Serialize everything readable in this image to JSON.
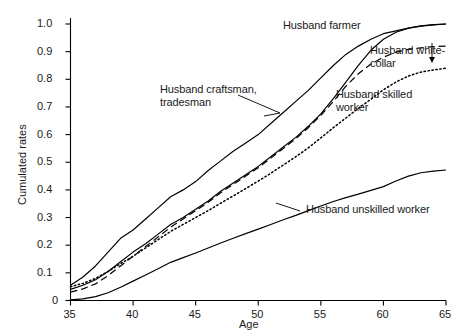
{
  "chart_data": {
    "type": "line",
    "title": "",
    "xlabel": "Age",
    "ylabel": "Cumulated rates",
    "xlim": [
      35,
      65
    ],
    "ylim": [
      0,
      1.0
    ],
    "xticks": [
      35,
      40,
      45,
      50,
      55,
      60,
      65
    ],
    "xtick_labels": [
      "35",
      "40",
      "45",
      "50",
      "55",
      "60",
      "65"
    ],
    "yticks": [
      0,
      0.1,
      0.2,
      0.3,
      0.4,
      0.5,
      0.6,
      0.7,
      0.8,
      0.9,
      1.0
    ],
    "ytick_labels": [
      "0",
      "0.1",
      "0.2",
      "0.3",
      "0.4",
      "0.5",
      "0.6",
      "0.7",
      "0.8",
      "0.9",
      "1.0"
    ],
    "grid": false,
    "legend_position": "inline-annotations",
    "x": [
      35,
      36,
      37,
      38,
      39,
      40,
      41,
      42,
      43,
      44,
      45,
      46,
      47,
      48,
      49,
      50,
      51,
      52,
      53,
      54,
      55,
      56,
      57,
      58,
      59,
      60,
      61,
      62,
      63,
      64,
      65
    ],
    "series": [
      {
        "name": "Husband farmer",
        "style": "solid",
        "color": "#000000",
        "values": [
          0.055,
          0.085,
          0.125,
          0.175,
          0.225,
          0.255,
          0.295,
          0.335,
          0.375,
          0.4,
          0.43,
          0.47,
          0.505,
          0.54,
          0.57,
          0.6,
          0.64,
          0.68,
          0.72,
          0.76,
          0.805,
          0.85,
          0.89,
          0.92,
          0.945,
          0.965,
          0.975,
          0.985,
          0.992,
          0.997,
          1.0
        ]
      },
      {
        "name": "Husband craftsman, tradesman",
        "style": "solid",
        "color": "#000000",
        "values": [
          0.04,
          0.055,
          0.075,
          0.105,
          0.14,
          0.175,
          0.205,
          0.24,
          0.275,
          0.3,
          0.33,
          0.36,
          0.395,
          0.425,
          0.455,
          0.485,
          0.52,
          0.555,
          0.59,
          0.63,
          0.675,
          0.73,
          0.79,
          0.85,
          0.905,
          0.945,
          0.97,
          0.985,
          0.993,
          0.998,
          1.0
        ]
      },
      {
        "name": "Husband white-collar",
        "style": "dashed",
        "color": "#000000",
        "values": [
          0.03,
          0.042,
          0.06,
          0.09,
          0.125,
          0.16,
          0.195,
          0.23,
          0.265,
          0.295,
          0.325,
          0.355,
          0.39,
          0.42,
          0.45,
          0.48,
          0.515,
          0.55,
          0.585,
          0.625,
          0.67,
          0.72,
          0.775,
          0.82,
          0.855,
          0.88,
          0.898,
          0.908,
          0.914,
          0.918,
          0.92
        ]
      },
      {
        "name": "Husband skilled worker",
        "style": "dotted",
        "color": "#000000",
        "values": [
          0.05,
          0.062,
          0.08,
          0.105,
          0.133,
          0.16,
          0.19,
          0.22,
          0.25,
          0.275,
          0.3,
          0.325,
          0.352,
          0.378,
          0.405,
          0.432,
          0.46,
          0.49,
          0.52,
          0.552,
          0.588,
          0.625,
          0.66,
          0.695,
          0.728,
          0.762,
          0.79,
          0.812,
          0.826,
          0.834,
          0.84
        ]
      },
      {
        "name": "Husband unskilled worker",
        "style": "solid",
        "color": "#000000",
        "values": [
          0.002,
          0.006,
          0.014,
          0.028,
          0.048,
          0.07,
          0.092,
          0.115,
          0.138,
          0.155,
          0.172,
          0.19,
          0.208,
          0.225,
          0.242,
          0.258,
          0.275,
          0.292,
          0.308,
          0.325,
          0.342,
          0.358,
          0.372,
          0.385,
          0.398,
          0.412,
          0.432,
          0.45,
          0.462,
          0.468,
          0.472
        ]
      }
    ],
    "annotations": [
      {
        "id": "farmer",
        "text": "Husband farmer",
        "x_px": 283,
        "y_px": 25,
        "leader": false
      },
      {
        "id": "white_collar",
        "text": "Husband white-\ncollar",
        "x_px": 370,
        "y_px": 47,
        "leader": true
      },
      {
        "id": "craftsman",
        "text": "Husband craftsman,\ntradesman",
        "x_px": 160,
        "y_px": 88,
        "leader": true
      },
      {
        "id": "skilled",
        "text": "Husband skilled\nworker",
        "x_px": 336,
        "y_px": 92,
        "leader": false
      },
      {
        "id": "unskilled",
        "text": "Husband unskilled worker",
        "x_px": 306,
        "y_px": 208,
        "leader": false
      }
    ]
  }
}
